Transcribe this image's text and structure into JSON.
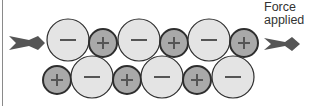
{
  "figure": {
    "label_line1": "Force",
    "label_line2": "applied",
    "colors": {
      "negative_ion_fill": "#e4e4e4",
      "positive_ion_fill": "#a9a9a9",
      "outline": "#2e2e2e",
      "arrow": "#555555"
    },
    "top_row": [
      {
        "sign": "−",
        "type": "negative",
        "cx": 68,
        "cy": 40,
        "r": 21
      },
      {
        "sign": "+",
        "type": "positive",
        "cx": 103,
        "cy": 43,
        "r": 14
      },
      {
        "sign": "−",
        "type": "negative",
        "cx": 139,
        "cy": 40,
        "r": 21
      },
      {
        "sign": "+",
        "type": "positive",
        "cx": 174,
        "cy": 43,
        "r": 14
      },
      {
        "sign": "−",
        "type": "negative",
        "cx": 209,
        "cy": 40,
        "r": 21
      },
      {
        "sign": "+",
        "type": "positive",
        "cx": 244,
        "cy": 43,
        "r": 14
      }
    ],
    "bottom_row": [
      {
        "sign": "+",
        "type": "positive",
        "cx": 57,
        "cy": 80,
        "r": 14
      },
      {
        "sign": "−",
        "type": "negative",
        "cx": 92,
        "cy": 77,
        "r": 21
      },
      {
        "sign": "+",
        "type": "positive",
        "cx": 127,
        "cy": 80,
        "r": 14
      },
      {
        "sign": "−",
        "type": "negative",
        "cx": 162,
        "cy": 77,
        "r": 21
      },
      {
        "sign": "+",
        "type": "positive",
        "cx": 197,
        "cy": 80,
        "r": 14
      },
      {
        "sign": "−",
        "type": "negative",
        "cx": 233,
        "cy": 77,
        "r": 21
      }
    ]
  }
}
